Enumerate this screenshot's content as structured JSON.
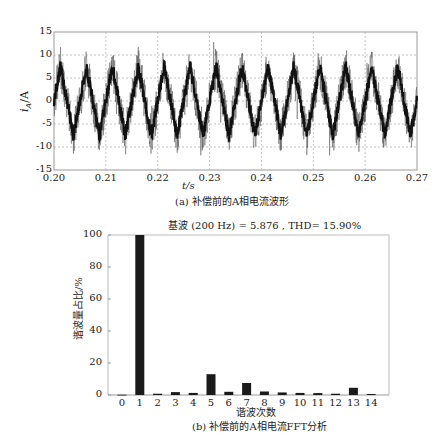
{
  "chart_data": [
    {
      "type": "line",
      "title": "",
      "caption": "(a) 补偿前的A相电流波形",
      "xlabel": "t/s",
      "ylabel": "i_A/A",
      "xlim": [
        0.2,
        0.27
      ],
      "ylim": [
        -15,
        15
      ],
      "x_ticks": [
        "0.20",
        "0.21",
        "0.22",
        "0.23",
        "0.24",
        "0.25",
        "0.26",
        "0.27"
      ],
      "y_ticks": [
        "15",
        "10",
        "5",
        "0",
        "-5",
        "-10",
        "-15"
      ],
      "grid": true,
      "grid_style": "dashed",
      "series": [
        {
          "name": "A相电流",
          "description": "Noisy triangular waveform ~200 Hz, amplitude ~±8 A with spikes to ±12 A",
          "frequency_hz": 200,
          "amplitude": 8,
          "peak": 12
        }
      ]
    },
    {
      "type": "bar",
      "title": "基波 (200 Hz) = 5.876 , THD= 15.90%",
      "caption": "(b) 补偿前的A相电流FFT分析",
      "xlabel": "谐波次数",
      "ylabel": "谐波量占比/%",
      "categories": [
        "0",
        "1",
        "2",
        "3",
        "4",
        "5",
        "6",
        "7",
        "8",
        "9",
        "10",
        "11",
        "12",
        "13",
        "14"
      ],
      "values": [
        0.2,
        100,
        0.8,
        1.8,
        1.3,
        13,
        2,
        7.5,
        2.2,
        1.6,
        1.3,
        1.2,
        0.8,
        4.5,
        0.6
      ],
      "ylim": [
        0,
        100
      ],
      "y_ticks": [
        "0",
        "20",
        "40",
        "60",
        "80",
        "100"
      ],
      "grid": false
    }
  ],
  "top": {
    "xlabel": "t/s",
    "ylabel_main": "i",
    "ylabel_sub": "A",
    "ylabel_unit": "/A",
    "caption": "(a) 补偿前的A相电流波形",
    "x_ticks": [
      "0.20",
      "0.21",
      "0.22",
      "0.23",
      "0.24",
      "0.25",
      "0.26",
      "0.27"
    ],
    "y_ticks": [
      "15",
      "10",
      "5",
      "0",
      "-5",
      "-10",
      "-15"
    ]
  },
  "bottom": {
    "title": "基波 (200 Hz) = 5.876 , THD= 15.90%",
    "ylabel": "谐波量占比/%",
    "xlabel": "谐波次数",
    "caption": "(b) 补偿前的A相电流FFT分析",
    "y_ticks": [
      "100",
      "80",
      "60",
      "40",
      "20",
      "0"
    ],
    "x_ticks": [
      "0",
      "1",
      "2",
      "3",
      "4",
      "5",
      "6",
      "7",
      "8",
      "9",
      "10",
      "11",
      "12",
      "13",
      "14"
    ],
    "values": [
      0.2,
      100,
      0.8,
      1.8,
      1.3,
      13,
      2,
      7.5,
      2.2,
      1.6,
      1.3,
      1.2,
      0.8,
      4.5,
      0.6
    ],
    "bar_color": "#1a1a1a"
  }
}
